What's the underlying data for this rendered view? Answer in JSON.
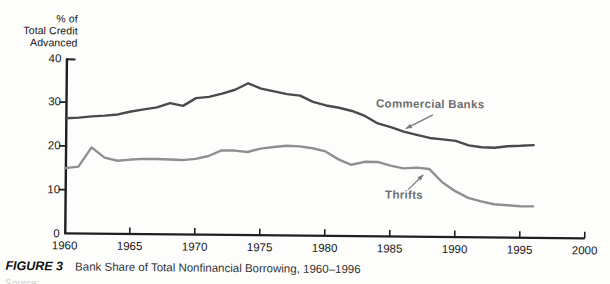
{
  "figure": {
    "y_axis_title_lines": [
      "% of",
      "Total Credit",
      "Advanced"
    ]
  },
  "annotations": {
    "commercial_banks": "Commercial Banks",
    "thrifts": "Thrifts"
  },
  "caption": {
    "figure_label": "FIGURE 3",
    "title": "Bank Share of Total Nonfinancial Borrowing, 1960–1996"
  },
  "footer": {
    "cropped_text": "Source:"
  },
  "colors": {
    "commercial_banks_line": "#4a4a4a",
    "thrifts_line": "#8f8f8f",
    "axis": "#1f1f1f",
    "annotation_text": "#6e6e6e"
  },
  "chart_data": {
    "type": "line",
    "title": "Bank Share of Total Nonfinancial Borrowing, 1960–1996",
    "ylabel": "% of Total Credit Advanced",
    "xlabel": "",
    "xlim": [
      1960,
      2000
    ],
    "ylim": [
      0,
      40
    ],
    "x_ticks": [
      1960,
      1965,
      1970,
      1975,
      1980,
      1985,
      1990,
      1995,
      2000
    ],
    "y_ticks": [
      0,
      10,
      20,
      30,
      40
    ],
    "grid": false,
    "legend_position": "inline-annotations",
    "x": [
      1960,
      1961,
      1962,
      1963,
      1964,
      1965,
      1966,
      1967,
      1968,
      1969,
      1970,
      1971,
      1972,
      1973,
      1974,
      1975,
      1976,
      1977,
      1978,
      1979,
      1980,
      1981,
      1982,
      1983,
      1984,
      1985,
      1986,
      1987,
      1988,
      1989,
      1990,
      1991,
      1992,
      1993,
      1994,
      1995,
      1996
    ],
    "series": [
      {
        "name": "Commercial Banks",
        "color": "#4a4a4a",
        "values": [
          26.3,
          26.5,
          26.8,
          27.0,
          27.3,
          28.0,
          28.5,
          29.0,
          30.0,
          29.4,
          31.2,
          31.5,
          32.3,
          33.2,
          34.7,
          33.5,
          32.9,
          32.3,
          32.0,
          30.6,
          29.8,
          29.3,
          28.6,
          27.5,
          25.8,
          25.0,
          24.0,
          23.3,
          22.6,
          22.3,
          22.0,
          21.0,
          20.6,
          20.5,
          20.9,
          21.0,
          21.2
        ]
      },
      {
        "name": "Thrifts",
        "color": "#8f8f8f",
        "values": [
          14.9,
          15.3,
          19.7,
          17.4,
          16.7,
          17.0,
          17.2,
          17.2,
          17.1,
          17.0,
          17.3,
          18.0,
          19.3,
          19.3,
          19.0,
          19.8,
          20.2,
          20.5,
          20.4,
          20.0,
          19.3,
          17.5,
          16.3,
          17.0,
          17.0,
          16.2,
          15.6,
          15.8,
          15.5,
          12.5,
          10.5,
          9.0,
          8.2,
          7.6,
          7.4,
          7.2,
          7.2
        ]
      }
    ]
  }
}
